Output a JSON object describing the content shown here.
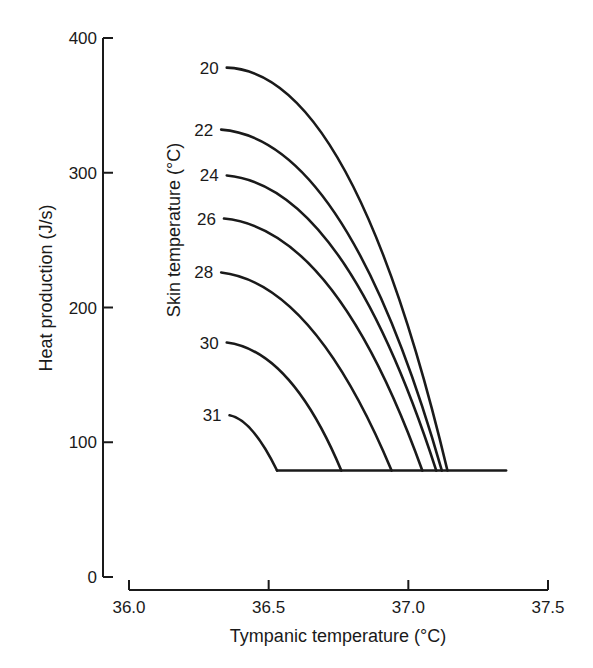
{
  "chart_data": {
    "type": "line",
    "title": "",
    "xlabel": "Tympanic temperature (°C)",
    "ylabel": "Heat production (J/s)",
    "series_label_title": "Skin temperature (°C)",
    "xlim": [
      36.0,
      37.5
    ],
    "ylim": [
      0,
      400
    ],
    "x_ticks": [
      "36.0",
      "36.5",
      "37.0",
      "37.5"
    ],
    "y_ticks": [
      "0",
      "100",
      "200",
      "300",
      "400"
    ],
    "grid": false,
    "legend": "inline labels at left end of each curve",
    "baseline": {
      "name": "basal heat production",
      "y": 79,
      "x_start": 36.53,
      "x_end": 37.35
    },
    "series": [
      {
        "name": "20",
        "points": [
          [
            36.35,
            378
          ],
          [
            36.62,
            350
          ],
          [
            36.85,
            280
          ],
          [
            37.0,
            200
          ],
          [
            37.1,
            120
          ],
          [
            37.14,
            79
          ]
        ]
      },
      {
        "name": "22",
        "points": [
          [
            36.33,
            332
          ],
          [
            36.6,
            282
          ],
          [
            36.83,
            210
          ],
          [
            37.0,
            140
          ],
          [
            37.12,
            79
          ]
        ]
      },
      {
        "name": "24",
        "points": [
          [
            36.35,
            298
          ],
          [
            36.6,
            250
          ],
          [
            36.82,
            180
          ],
          [
            37.0,
            120
          ],
          [
            37.1,
            79
          ]
        ]
      },
      {
        "name": "26",
        "points": [
          [
            36.34,
            266
          ],
          [
            36.58,
            220
          ],
          [
            36.8,
            160
          ],
          [
            36.97,
            110
          ],
          [
            37.05,
            79
          ]
        ]
      },
      {
        "name": "28",
        "points": [
          [
            36.33,
            226
          ],
          [
            36.55,
            185
          ],
          [
            36.75,
            135
          ],
          [
            36.94,
            79
          ]
        ]
      },
      {
        "name": "30",
        "points": [
          [
            36.35,
            174
          ],
          [
            36.52,
            145
          ],
          [
            36.66,
            110
          ],
          [
            36.76,
            79
          ]
        ]
      },
      {
        "name": "31",
        "points": [
          [
            36.36,
            120
          ],
          [
            36.45,
            100
          ],
          [
            36.53,
            79
          ]
        ]
      }
    ]
  },
  "axes": {
    "x_title": "Tympanic temperature (°C)",
    "y_title": "Heat production (J/s)",
    "series_title": "Skin temperature (°C)",
    "x_ticks": [
      {
        "label": "36.0",
        "value": 36.0
      },
      {
        "label": "36.5",
        "value": 36.5
      },
      {
        "label": "37.0",
        "value": 37.0
      },
      {
        "label": "37.5",
        "value": 37.5
      }
    ],
    "y_ticks": [
      {
        "label": "0",
        "value": 0
      },
      {
        "label": "100",
        "value": 100
      },
      {
        "label": "200",
        "value": 200
      },
      {
        "label": "300",
        "value": 300
      },
      {
        "label": "400",
        "value": 400
      }
    ]
  },
  "curves": [
    {
      "label": "20",
      "start": [
        36.35,
        378
      ],
      "end": [
        37.14,
        79
      ],
      "ctrl": [
        36.8,
        375
      ]
    },
    {
      "label": "22",
      "start": [
        36.33,
        332
      ],
      "end": [
        37.12,
        79
      ],
      "ctrl": [
        36.78,
        325
      ]
    },
    {
      "label": "24",
      "start": [
        36.35,
        298
      ],
      "end": [
        37.1,
        79
      ],
      "ctrl": [
        36.77,
        290
      ]
    },
    {
      "label": "26",
      "start": [
        36.34,
        266
      ],
      "end": [
        37.05,
        79
      ],
      "ctrl": [
        36.74,
        258
      ]
    },
    {
      "label": "28",
      "start": [
        36.33,
        226
      ],
      "end": [
        36.94,
        79
      ],
      "ctrl": [
        36.66,
        218
      ]
    },
    {
      "label": "30",
      "start": [
        36.35,
        174
      ],
      "end": [
        36.76,
        79
      ],
      "ctrl": [
        36.58,
        168
      ]
    },
    {
      "label": "31",
      "start": [
        36.36,
        120
      ],
      "end": [
        36.53,
        79
      ],
      "ctrl": [
        36.44,
        117
      ]
    }
  ],
  "baseline": {
    "x_start": 36.53,
    "x_end": 37.35,
    "y": 79
  }
}
